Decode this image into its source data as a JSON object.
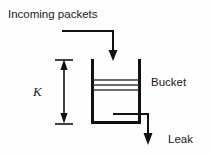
{
  "figure": {
    "background_color": "#fefefe",
    "ink_color": "#111111",
    "width": 210,
    "height": 156
  },
  "labels": {
    "incoming": "Incoming packets",
    "bucket": "Bucket",
    "leak": "Leak",
    "capacity": "K"
  },
  "icons": {
    "inflow_arrow": "arrow-down-icon",
    "leak_arrow": "arrow-down-icon",
    "dimension_top_arrow": "arrow-up-icon",
    "dimension_bottom_arrow": "arrow-down-icon"
  },
  "geometry": {
    "bucket": {
      "left_wall_x": 92,
      "right_wall_x": 140,
      "top_y": 59,
      "bottom_y": 124
    },
    "fill_levels": [
      80,
      85,
      90
    ],
    "inflow_path": "M62,31 H113 V58",
    "leak_path": "M113,114 H148 V140",
    "dimension_line_x": 64,
    "dimension_top_y": 59,
    "dimension_bottom_y": 124
  }
}
